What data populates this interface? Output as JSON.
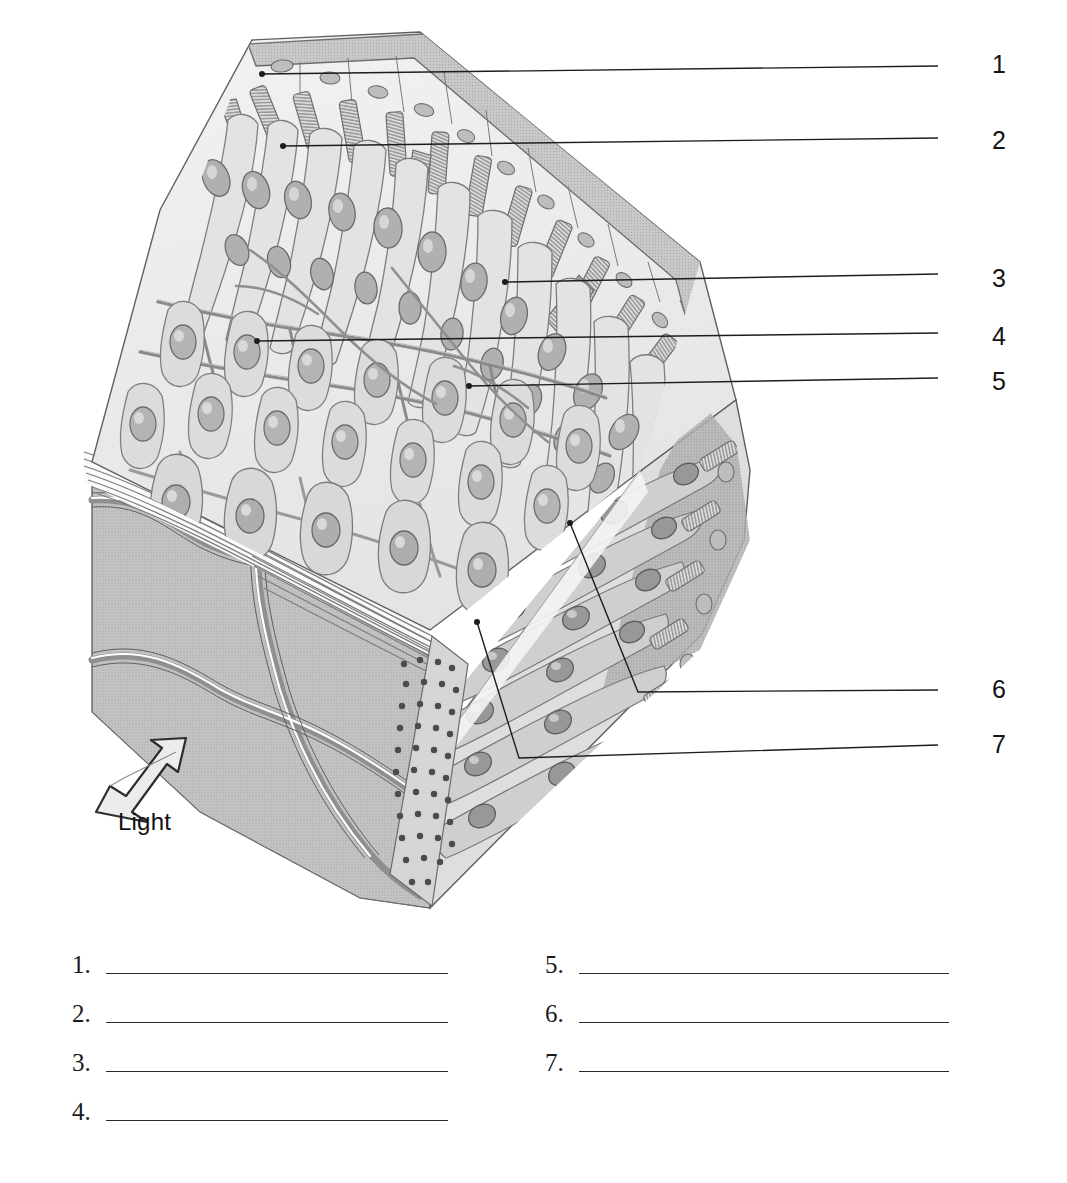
{
  "figure": {
    "type": "anatomical-diagram",
    "light_label": "Light",
    "leaders": [
      {
        "id": "1",
        "number": "1",
        "text_x": 992,
        "text_y": 52,
        "path": "M262,74 L938,66",
        "tip_x": 262,
        "tip_y": 74
      },
      {
        "id": "2",
        "number": "2",
        "text_x": 992,
        "text_y": 128,
        "path": "M283,146 L938,138",
        "tip_x": 283,
        "tip_y": 146
      },
      {
        "id": "3",
        "number": "3",
        "text_x": 992,
        "text_y": 268,
        "path": "M505,282 L938,274",
        "tip_x": 505,
        "tip_y": 282
      },
      {
        "id": "4",
        "number": "4",
        "text_x": 992,
        "text_y": 325,
        "path": "M257,341 L938,333",
        "tip_x": 257,
        "tip_y": 341
      },
      {
        "id": "5",
        "number": "5",
        "text_x": 992,
        "text_y": 370,
        "path": "M469,386 L938,378",
        "tip_x": 469,
        "tip_y": 386
      },
      {
        "id": "6",
        "number": "6",
        "text_x": 992,
        "text_y": 677,
        "path": "M570,523 L638,692 L938,690",
        "tip_x": 570,
        "tip_y": 523
      },
      {
        "id": "7",
        "number": "7",
        "text_x": 992,
        "text_y": 732,
        "path": "M477,622 L519,758 L938,745",
        "tip_x": 477,
        "tip_y": 622
      }
    ],
    "colors": {
      "outline": "#6f6f6f",
      "dark_outline": "#4a4a4a",
      "leader": "#1d1d1d",
      "cell_body": "#d9d9d9",
      "cell_light": "#efefef",
      "nucleus": "#a9a9a9",
      "nucleus_dark": "#8d8d8d",
      "pigment_band": "#bfbfbf",
      "side_face": "#c9c9c9",
      "bottom_face": "#b7b7b7",
      "vessel": "#9a9a9a",
      "pigment_dots": "#5a5a5a",
      "text": "#141414",
      "rule": "#2b2b2b"
    }
  },
  "answers": {
    "left": [
      {
        "number": "1."
      },
      {
        "number": "2."
      },
      {
        "number": "3."
      },
      {
        "number": "4."
      }
    ],
    "right": [
      {
        "number": "5."
      },
      {
        "number": "6."
      },
      {
        "number": "7."
      }
    ]
  }
}
